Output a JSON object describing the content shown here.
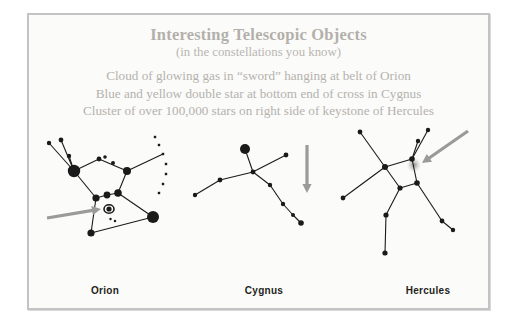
{
  "slide": {
    "background_color": "#fbfbfa",
    "border_color": "#c3c3c3",
    "heading_color": "#b3b0ab",
    "body_text_color": "#b5b2ad",
    "star_color": "#1a1a1a",
    "arrow_color": "#9a9a9a",
    "label_color": "#231f20"
  },
  "header": {
    "title": "Interesting Telescopic Objects",
    "subtitle": "(in the constellations you know)"
  },
  "bullets": [
    "Cloud of glowing gas in “sword” hanging at belt of Orion",
    "Blue and yellow double star at bottom end of cross in Cygnus",
    "Cluster of over 100,000 stars on right side of keystone of Hercules"
  ],
  "panels": [
    {
      "id": "orion",
      "label": "Orion",
      "target_object": "nebula-open-circle",
      "arrow": "arrow-pointing-right"
    },
    {
      "id": "cygnus",
      "label": "Cygnus",
      "target_object": "double-star-bottom-of-cross",
      "arrow": "arrow-pointing-down"
    },
    {
      "id": "hercules",
      "label": "Hercules",
      "target_object": "globular-cluster-glow",
      "arrow": "arrow-pointing-down-left"
    }
  ],
  "chart_data": {
    "type": "scatter",
    "title": "Interesting Telescopic Objects",
    "subtitle": "(in the constellations you know)",
    "xlabel": "",
    "ylabel": "",
    "grid": false,
    "legend": "none",
    "series": [
      {
        "name": "Orion",
        "stars": [
          {
            "x": 14,
            "y": 16,
            "r": 2.2
          },
          {
            "x": 26,
            "y": 13,
            "r": 2.4
          },
          {
            "x": 34,
            "y": 29,
            "r": 2.2
          },
          {
            "x": 39,
            "y": 44,
            "r": 6.2
          },
          {
            "x": 64,
            "y": 32,
            "r": 2.4
          },
          {
            "x": 70,
            "y": 30,
            "r": 1.8
          },
          {
            "x": 78,
            "y": 36,
            "r": 2.0
          },
          {
            "x": 92,
            "y": 44,
            "r": 4.0
          },
          {
            "x": 61,
            "y": 71,
            "r": 3.6
          },
          {
            "x": 72,
            "y": 68,
            "r": 3.4
          },
          {
            "x": 83,
            "y": 66,
            "r": 3.8
          },
          {
            "x": 118,
            "y": 90,
            "r": 6.0
          },
          {
            "x": 56,
            "y": 106,
            "r": 3.6
          },
          {
            "x": 74,
            "y": 82,
            "r": 2.6
          }
        ],
        "dotted_arc": [
          {
            "x": 120,
            "y": 10
          },
          {
            "x": 124,
            "y": 18
          },
          {
            "x": 128,
            "y": 27
          },
          {
            "x": 131,
            "y": 37
          },
          {
            "x": 131,
            "y": 47
          },
          {
            "x": 128,
            "y": 57
          },
          {
            "x": 124,
            "y": 66
          }
        ],
        "lines": [
          [
            [
              14,
              16
            ],
            [
              39,
              44
            ]
          ],
          [
            [
              26,
              13
            ],
            [
              39,
              44
            ]
          ],
          [
            [
              34,
              29
            ],
            [
              39,
              44
            ]
          ],
          [
            [
              39,
              44
            ],
            [
              64,
              32
            ]
          ],
          [
            [
              64,
              32
            ],
            [
              92,
              44
            ]
          ],
          [
            [
              92,
              44
            ],
            [
              128,
              27
            ]
          ],
          [
            [
              39,
              44
            ],
            [
              61,
              71
            ]
          ],
          [
            [
              92,
              44
            ],
            [
              83,
              66
            ]
          ],
          [
            [
              61,
              71
            ],
            [
              72,
              68
            ]
          ],
          [
            [
              72,
              68
            ],
            [
              83,
              66
            ]
          ],
          [
            [
              83,
              66
            ],
            [
              118,
              90
            ]
          ],
          [
            [
              61,
              71
            ],
            [
              56,
              106
            ]
          ],
          [
            [
              56,
              106
            ],
            [
              118,
              90
            ]
          ]
        ],
        "nebula": {
          "x": 74,
          "y": 82,
          "rx": 5.0,
          "ry": 4.2
        },
        "arrow": {
          "from": [
            12,
            91
          ],
          "to": [
            66,
            82
          ]
        }
      },
      {
        "name": "Cygnus",
        "stars": [
          {
            "x": 56,
            "y": 22,
            "r": 5.0
          },
          {
            "x": 64,
            "y": 45,
            "r": 2.4
          },
          {
            "x": 97,
            "y": 28,
            "r": 2.4
          },
          {
            "x": 31,
            "y": 53,
            "r": 2.4
          },
          {
            "x": 6,
            "y": 68,
            "r": 2.2
          },
          {
            "x": 81,
            "y": 58,
            "r": 2.2
          },
          {
            "x": 94,
            "y": 77,
            "r": 2.2
          },
          {
            "x": 104,
            "y": 88,
            "r": 2.0
          },
          {
            "x": 112,
            "y": 96,
            "r": 2.8
          }
        ],
        "lines": [
          [
            [
              56,
              22
            ],
            [
              64,
              45
            ]
          ],
          [
            [
              64,
              45
            ],
            [
              97,
              28
            ]
          ],
          [
            [
              64,
              45
            ],
            [
              31,
              53
            ]
          ],
          [
            [
              31,
              53
            ],
            [
              6,
              68
            ]
          ],
          [
            [
              64,
              45
            ],
            [
              81,
              58
            ]
          ],
          [
            [
              81,
              58
            ],
            [
              94,
              77
            ]
          ],
          [
            [
              94,
              77
            ],
            [
              104,
              88
            ]
          ],
          [
            [
              104,
              88
            ],
            [
              112,
              96
            ]
          ]
        ],
        "arrow": {
          "from": [
            118,
            18
          ],
          "to": [
            118,
            66
          ]
        }
      },
      {
        "name": "Hercules",
        "stars": [
          {
            "x": 31,
            "y": 5,
            "r": 2.4
          },
          {
            "x": 99,
            "y": 3,
            "r": 2.2
          },
          {
            "x": 89,
            "y": 14,
            "r": 2.2
          },
          {
            "x": 56,
            "y": 40,
            "r": 3.0
          },
          {
            "x": 83,
            "y": 32,
            "r": 2.8
          },
          {
            "x": 88,
            "y": 56,
            "r": 2.8
          },
          {
            "x": 71,
            "y": 61,
            "r": 2.6
          },
          {
            "x": 14,
            "y": 71,
            "r": 2.4
          },
          {
            "x": 57,
            "y": 88,
            "r": 2.6
          },
          {
            "x": 56,
            "y": 126,
            "r": 2.6
          },
          {
            "x": 113,
            "y": 94,
            "r": 2.4
          },
          {
            "x": 124,
            "y": 103,
            "r": 2.2
          }
        ],
        "lines": [
          [
            [
              31,
              5
            ],
            [
              56,
              40
            ]
          ],
          [
            [
              56,
              40
            ],
            [
              83,
              32
            ]
          ],
          [
            [
              83,
              32
            ],
            [
              99,
              3
            ]
          ],
          [
            [
              83,
              32
            ],
            [
              89,
              14
            ]
          ],
          [
            [
              83,
              32
            ],
            [
              88,
              56
            ]
          ],
          [
            [
              88,
              56
            ],
            [
              71,
              61
            ]
          ],
          [
            [
              71,
              61
            ],
            [
              56,
              40
            ]
          ],
          [
            [
              56,
              40
            ],
            [
              14,
              71
            ]
          ],
          [
            [
              71,
              61
            ],
            [
              57,
              88
            ]
          ],
          [
            [
              57,
              88
            ],
            [
              56,
              126
            ]
          ],
          [
            [
              88,
              56
            ],
            [
              113,
              94
            ]
          ],
          [
            [
              113,
              94
            ],
            [
              124,
              103
            ]
          ]
        ],
        "cluster_glow": {
          "x": 85,
          "y": 38,
          "r": 7.5
        },
        "arrow": {
          "from": [
            139,
            4
          ],
          "to": [
            93,
            36
          ]
        }
      }
    ]
  }
}
